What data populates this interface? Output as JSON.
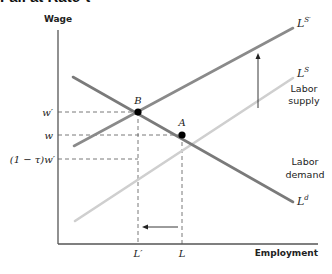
{
  "title_fragment": "Fall at Rate τ",
  "axes": {
    "y_label": "Wage",
    "x_label": "Employment"
  },
  "y_ticks": {
    "w_prime": "w′",
    "w": "w",
    "after_tax": "(1 − τ)w′"
  },
  "x_ticks": {
    "L_prime": "L′",
    "L": "L"
  },
  "points": {
    "B": "B",
    "A": "A"
  },
  "curves": {
    "supply_shifted": {
      "symbol": "L",
      "sup": "S′"
    },
    "supply": {
      "symbol": "L",
      "sup": "S",
      "caption_line1": "Labor",
      "caption_line2": "supply"
    },
    "demand": {
      "symbol": "L",
      "sup": "d",
      "caption_line1": "Labor",
      "caption_line2": "demand"
    }
  },
  "colors": {
    "axis": "#555555",
    "demand": "#7a7a7a",
    "supply_shifted": "#8a8a8a",
    "supply": "#cfcfcf",
    "dash": "#555555",
    "point": "#000000",
    "text": "#222222"
  }
}
